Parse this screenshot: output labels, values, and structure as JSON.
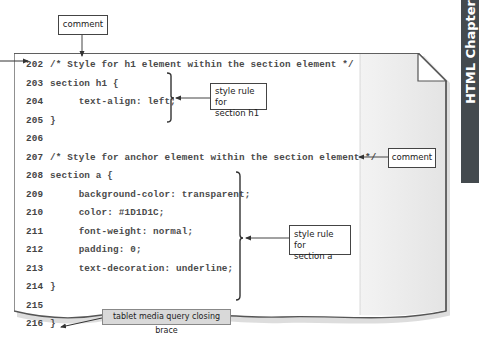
{
  "side_tab": {
    "label": "HTML Chapter"
  },
  "code_lines": [
    {
      "num": "202",
      "text": "/* Style for h1 element within the section element */"
    },
    {
      "num": "203",
      "text": "section h1 {"
    },
    {
      "num": "204",
      "text": "     text-align: left;"
    },
    {
      "num": "205",
      "text": "}"
    },
    {
      "num": "206",
      "text": ""
    },
    {
      "num": "207",
      "text": "/* Style for anchor element within the section element */"
    },
    {
      "num": "208",
      "text": "section a {"
    },
    {
      "num": "209",
      "text": "     background-color: transparent;"
    },
    {
      "num": "210",
      "text": "     color: #1D1D1C;"
    },
    {
      "num": "211",
      "text": "     font-weight: normal;"
    },
    {
      "num": "212",
      "text": "     padding: 0;"
    },
    {
      "num": "213",
      "text": "     text-decoration: underline;"
    },
    {
      "num": "214",
      "text": "}"
    },
    {
      "num": "215",
      "text": ""
    },
    {
      "num": "216",
      "text": "}"
    }
  ],
  "callouts": {
    "comment_top": "comment",
    "style_rule_h1_line1": "style rule for",
    "style_rule_h1_line2": "section h1",
    "comment_right": "comment",
    "style_rule_a_line1": "style rule for",
    "style_rule_a_line2": "section a",
    "closing_brace": "tablet media query closing brace"
  }
}
